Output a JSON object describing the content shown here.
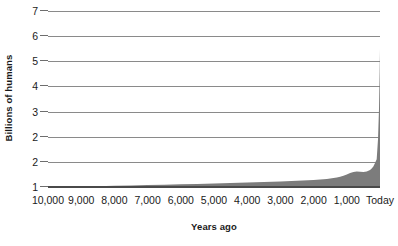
{
  "chart_data": {
    "type": "area",
    "title": "",
    "xlabel": "Years ago",
    "ylabel": "Billions of humans",
    "grid": true,
    "legend": "none",
    "x_axis": {
      "tick_labels": [
        "10,000",
        "9,000",
        "8,000",
        "7,000",
        "6,000",
        "5,000",
        "4,000",
        "3,000",
        "2,000",
        "1,000",
        "Today"
      ],
      "tick_values": [
        10000,
        9000,
        8000,
        7000,
        6000,
        5000,
        4000,
        3000,
        2000,
        1000,
        0
      ],
      "direction": "reversed",
      "xlim": [
        10000,
        0
      ]
    },
    "y_axis": {
      "tick_labels": [
        "7",
        "6",
        "5",
        "4",
        "3",
        "2",
        "2",
        "1"
      ],
      "tick_values": [
        7,
        6,
        5,
        4,
        3,
        2,
        2,
        1
      ],
      "note": "source graphic repeats the label 2 on two adjacent evenly spaced gridlines",
      "ylim": [
        1,
        7
      ],
      "gridline_count": 8
    },
    "series": [
      {
        "name": "World population",
        "x": [
          10000,
          9500,
          9000,
          8500,
          8000,
          7500,
          7000,
          6500,
          6000,
          5500,
          5000,
          4500,
          4000,
          3500,
          3000,
          2500,
          2000,
          1800,
          1600,
          1500,
          1400,
          1300,
          1200,
          1100,
          1000,
          900,
          800,
          700,
          600,
          500,
          400,
          300,
          250,
          200,
          150,
          100,
          60,
          30,
          10,
          0
        ],
        "y": [
          1.0,
          1.01,
          1.02,
          1.03,
          1.05,
          1.06,
          1.08,
          1.09,
          1.11,
          1.12,
          1.14,
          1.16,
          1.18,
          1.2,
          1.22,
          1.25,
          1.28,
          1.3,
          1.32,
          1.34,
          1.36,
          1.38,
          1.41,
          1.45,
          1.5,
          1.56,
          1.6,
          1.62,
          1.61,
          1.6,
          1.62,
          1.68,
          1.74,
          1.82,
          1.95,
          2.1,
          2.9,
          4.1,
          5.6,
          6.5
        ],
        "peak_value": 6.5,
        "baseline_value": 1.0
      }
    ],
    "colors": {
      "area_fill": "#7c7c7c",
      "gridline": "#8a8a8a",
      "baseline": "#4a4a4a",
      "text": "#1a1a1a",
      "background": "#ffffff"
    }
  }
}
